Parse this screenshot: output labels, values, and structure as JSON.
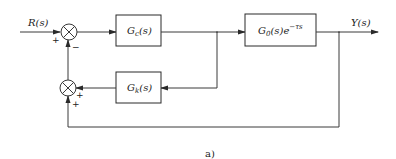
{
  "diagram": {
    "type": "control-block-diagram",
    "caption": "a)",
    "signals": {
      "input": "R(s)",
      "output": "Y(s)"
    },
    "blocks": [
      {
        "id": "gc",
        "label_main": "G",
        "label_sub": "c",
        "label_tail": "(s)",
        "full": "Gc(s)"
      },
      {
        "id": "g0",
        "label_main": "G",
        "label_sub": "0",
        "label_tail": "(s)e",
        "label_sup": "−τs",
        "full": "G0(s)e^(−τs)"
      },
      {
        "id": "gk",
        "label_main": "G",
        "label_sub": "k",
        "label_tail": "(s)",
        "full": "Gk(s)"
      }
    ],
    "summing_junctions": [
      {
        "id": "sum1",
        "inputs": [
          {
            "from": "R(s)",
            "sign": "+"
          },
          {
            "from": "sum2",
            "sign": "−"
          }
        ]
      },
      {
        "id": "sum2",
        "inputs": [
          {
            "from": "Gk(s)",
            "sign": "+"
          },
          {
            "from": "Y(s)",
            "sign": "+"
          }
        ]
      }
    ],
    "signs": {
      "sum1_left": "+",
      "sum1_bottom": "−",
      "sum2_right": "+",
      "sum2_bottom": "+"
    }
  }
}
